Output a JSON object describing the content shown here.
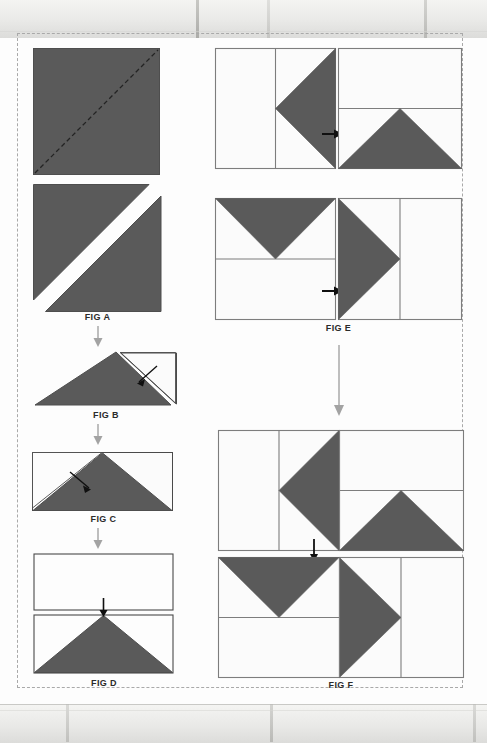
{
  "document": {
    "title": "Quilt Block Assembly Instructions",
    "page_background": "#fdfdfd",
    "fabric_color": "#5a5a5a",
    "background_fabric_color": "#fefefe",
    "outline_color": "#4a4a4a",
    "arrow_color": "#1a1a1a",
    "flow_arrow_color": "#9a9a9a",
    "sheet_border_style": "dashed"
  },
  "figures": [
    {
      "id": "fig-a",
      "label": "FIG A",
      "column": "left",
      "description": "Solid dark square marked with a dashed diagonal cutting line from lower-left to upper-right, shown above the same square cut apart into two half-square triangles.",
      "steps": [
        {
          "name": "marked-square",
          "shape": "square",
          "fill": "dark",
          "marking": "dashed-diagonal"
        },
        {
          "name": "cut-square",
          "shape": "square-split-diagonal",
          "fill": "dark",
          "marking": "cut-line"
        }
      ]
    },
    {
      "id": "fig-b",
      "label": "FIG B",
      "column": "left",
      "description": "Dark half-square triangle with a light background triangle placed at the right edge; a small solid arrow points to the seam.",
      "arrow": "diagonal-pointer"
    },
    {
      "id": "fig-c",
      "label": "FIG C",
      "column": "left",
      "description": "Rectangle unit with a centered dark flying-geese triangle; a light background triangle is added at the left with a small solid arrow pointing to the seam.",
      "arrow": "diagonal-pointer"
    },
    {
      "id": "fig-d",
      "label": "FIG D",
      "column": "left",
      "description": "A plain light rectangle joined above a finished flying-geese rectangle; a short downward arrow marks the joining seam.",
      "arrow": "down"
    },
    {
      "id": "fig-e",
      "label": "FIG E",
      "column": "right",
      "description": "Four square units arranged two across and two down. Each unit pairs a flying-geese rectangle with a plain rectangle; small solid arrows on the left of the right-hand units show the joining direction.",
      "units": [
        {
          "position": "top-left",
          "geese_direction": "left",
          "plain_side": "left"
        },
        {
          "position": "top-right",
          "geese_direction": "up",
          "plain_side": "top"
        },
        {
          "position": "bottom-left",
          "geese_direction": "down",
          "plain_side": "bottom"
        },
        {
          "position": "bottom-right",
          "geese_direction": "right",
          "plain_side": "right"
        }
      ],
      "arrows": [
        "right",
        "right"
      ]
    },
    {
      "id": "fig-f",
      "label": "FIG F",
      "column": "right",
      "description": "The four units sewn into two rows then joined; a short downward arrow marks the centre seam of the completed pinwheel-style block.",
      "rows": [
        {
          "name": "top-row",
          "units": [
            "geese-left",
            "geese-up"
          ]
        },
        {
          "name": "bottom-row",
          "units": [
            "geese-down",
            "geese-right"
          ]
        }
      ],
      "arrow": "down"
    }
  ],
  "flow_arrows": [
    {
      "from": "fig-a",
      "to": "fig-b",
      "direction": "down"
    },
    {
      "from": "fig-b",
      "to": "fig-c",
      "direction": "down"
    },
    {
      "from": "fig-c",
      "to": "fig-d",
      "direction": "down"
    },
    {
      "from": "fig-e",
      "to": "fig-f",
      "direction": "down"
    }
  ]
}
